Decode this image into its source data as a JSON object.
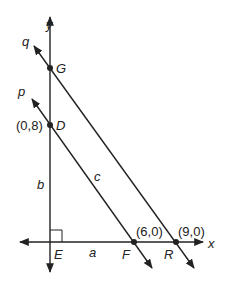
{
  "diagram": {
    "axes": {
      "x_label": "x",
      "y_label": "y"
    },
    "lines": [
      {
        "name": "p",
        "label": "p",
        "passes_through": [
          "D",
          "F"
        ]
      },
      {
        "name": "q",
        "label": "q",
        "passes_through": [
          "G",
          "R"
        ]
      }
    ],
    "points": {
      "G": {
        "label": "G"
      },
      "D": {
        "label": "D",
        "coord": "(0,8)"
      },
      "E": {
        "label": "E"
      },
      "F": {
        "label": "F",
        "coord": "(6,0)"
      },
      "R": {
        "label": "R",
        "coord": "(9,0)"
      }
    },
    "segments": {
      "a": "a",
      "b": "b",
      "c": "c"
    },
    "colors": {
      "stroke": "#222222",
      "background": "#ffffff"
    }
  }
}
